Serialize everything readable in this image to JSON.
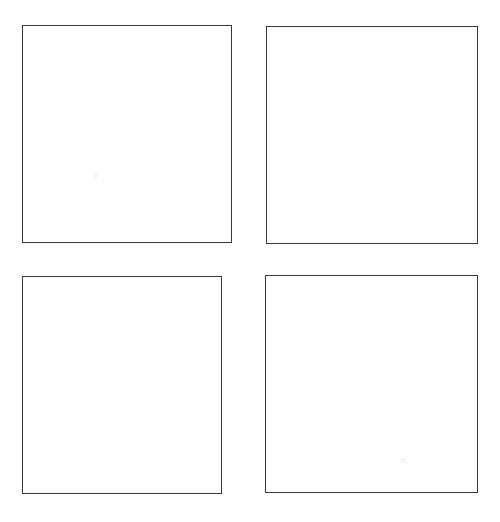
{
  "page": {
    "background_color": "#ffffff",
    "width": 500,
    "height": 522
  },
  "grid": {
    "rows": 2,
    "columns": 2,
    "panel_count": 4,
    "border_color": "#3a3a3a",
    "border_width_px": 1.4,
    "fill_color": "#ffffff"
  },
  "panels": [
    {
      "id": "panel-top-left",
      "position": "top-left",
      "label": "",
      "content": "",
      "x": 22,
      "y": 25,
      "width": 210,
      "height": 218,
      "marks": [
        {
          "name": "faint-speck",
          "x": 70,
          "y": 146,
          "color": "#f7f7f8"
        }
      ]
    },
    {
      "id": "panel-top-right",
      "position": "top-right",
      "label": "",
      "content": "",
      "x": 266,
      "y": 26,
      "width": 212,
      "height": 218,
      "marks": []
    },
    {
      "id": "panel-bottom-left",
      "position": "bottom-left",
      "label": "",
      "content": "",
      "x": 22,
      "y": 276,
      "width": 200,
      "height": 218,
      "marks": []
    },
    {
      "id": "panel-bottom-right",
      "position": "bottom-right",
      "label": "",
      "content": "",
      "x": 265,
      "y": 275,
      "width": 213,
      "height": 218,
      "marks": [
        {
          "name": "faint-speck",
          "x": 134,
          "y": 182,
          "color": "#f7f7f8"
        }
      ]
    }
  ]
}
